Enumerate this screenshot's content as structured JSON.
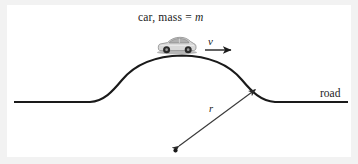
{
  "figure": {
    "domain": "Diagram",
    "background_color": "#f2f2f2",
    "plate_color": "#ffffff",
    "ink_color": "#1a1a1a"
  },
  "labels": {
    "caption_prefix": "car, mass = ",
    "caption_symbol": "m",
    "velocity_symbol": "v",
    "radius_symbol": "r",
    "road_label": "road"
  },
  "geometry": {
    "road_left_start_x": 14,
    "road_left_end_x": 90,
    "road_right_start_x": 275,
    "road_right_end_x": 348,
    "road_y": 102,
    "hill_apex_x": 182,
    "hill_apex_y": 56,
    "circle_center_x": 175,
    "circle_center_y": 150,
    "radius_arrow_tip_x": 258,
    "radius_arrow_tip_y": 87,
    "velocity_arrow_start_x": 205,
    "velocity_arrow_end_x": 233,
    "velocity_arrow_y": 50,
    "car_center_x": 177,
    "car_center_y": 47
  },
  "car": {
    "body_color": "#d8d8d8",
    "body_stroke": "#8c8c8c",
    "window_color": "#b0b0b0",
    "wheel_color": "#2a2a2a",
    "wheel_hub_color": "#9a9a9a",
    "length": 40,
    "height": 13
  },
  "colors": {
    "line": "#1a1a1a",
    "arrow": "#3a3a3a",
    "text": "#1a1a1a",
    "margin": "#f2f2f2"
  }
}
